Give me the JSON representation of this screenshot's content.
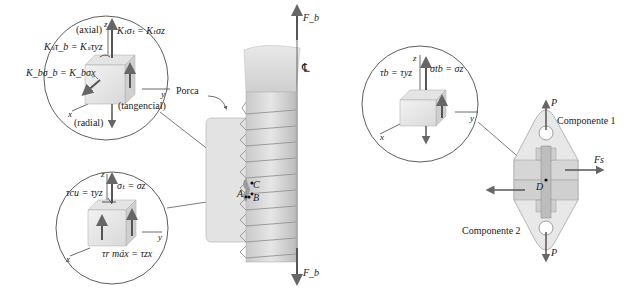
{
  "figure": {
    "left_panel": {
      "nut_label": "Porca",
      "centerline_symbol": "℄",
      "force_top": "F_b",
      "force_bottom": "F_b",
      "points": [
        "A",
        "B",
        "C"
      ],
      "top_inset": {
        "axis_z": "z",
        "axis_y": "y",
        "axis_x": "x",
        "label_axial": "(axial)",
        "label_tangencial": "(tangencial)",
        "label_radial": "(radial)",
        "eq_axial_stress": "Kₜσₜ = Kₜσz",
        "eq_shear": "Kₛτ_b = Kₛτyz",
        "eq_bending": "K_bσ_b = K_bσx"
      },
      "bottom_inset": {
        "axis_z": "z",
        "axis_y": "y",
        "axis_x": "x",
        "eq_axial_stress": "σₜ = σz",
        "eq_shear": "τcu = τyz",
        "eq_max_shear": "τr máx = τzx"
      }
    },
    "right_panel": {
      "component_1": "Componente 1",
      "component_2": "Componente 2",
      "force_top": "P",
      "force_bottom": "P",
      "force_shear": "Fs",
      "point": "D",
      "inset": {
        "axis_z": "z",
        "axis_y": "y",
        "axis_x": "x",
        "eq_shear": "τb = τyz",
        "eq_axial": "σtb = σz"
      }
    }
  }
}
